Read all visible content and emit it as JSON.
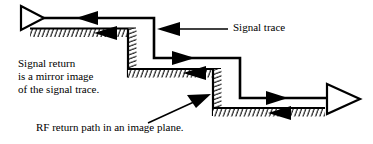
{
  "figure": {
    "kind": "signal-trace-return-path-diagram",
    "background_color": "#ffffff",
    "ink_color": "#000000"
  },
  "labels": {
    "signal_trace": "Signal trace",
    "signal_return": {
      "line1": "Signal return",
      "line2": "is a mirror image",
      "line3": "of the signal trace."
    },
    "rf_return": "RF return path in an image plane."
  },
  "symbols": {
    "driver_label": "driver-triangle",
    "receiver_label": "receiver-triangle"
  },
  "arrows": {
    "trace_forward_1": "right",
    "trace_forward_2": "right",
    "trace_forward_3": "right",
    "return_reverse_1": "left",
    "return_reverse_2": "left",
    "return_reverse_3": "left",
    "leader_signal_trace": "left",
    "leader_rf_return": "up-right"
  }
}
